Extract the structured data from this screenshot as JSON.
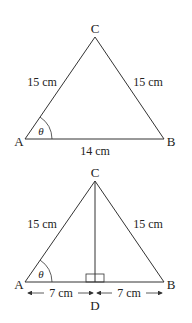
{
  "figure1": {
    "vertices": {
      "A": "A",
      "B": "B",
      "C": "C"
    },
    "side_ac": "15 cm",
    "side_bc": "15 cm",
    "side_ab": "14 cm",
    "angle": "θ"
  },
  "figure2": {
    "vertices": {
      "A": "A",
      "B": "B",
      "C": "C",
      "D": "D"
    },
    "side_ac": "15 cm",
    "side_bc": "15 cm",
    "segment_ad": "7 cm",
    "segment_db": "7 cm",
    "angle": "θ"
  },
  "colors": {
    "line": "#333333",
    "text": "#222222"
  }
}
